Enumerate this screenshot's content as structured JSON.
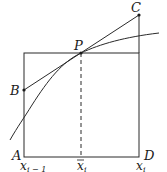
{
  "diagram": {
    "points": {
      "A": "A",
      "B": "B",
      "C": "C",
      "D": "D",
      "P": "P"
    },
    "axis_labels": {
      "left": "x",
      "left_sub": "i − 1",
      "mid": "x",
      "mid_sub": "i",
      "right": "x",
      "right_sub": "i"
    },
    "colors": {
      "stroke": "#2a2a2a",
      "background": "#ffffff"
    }
  }
}
